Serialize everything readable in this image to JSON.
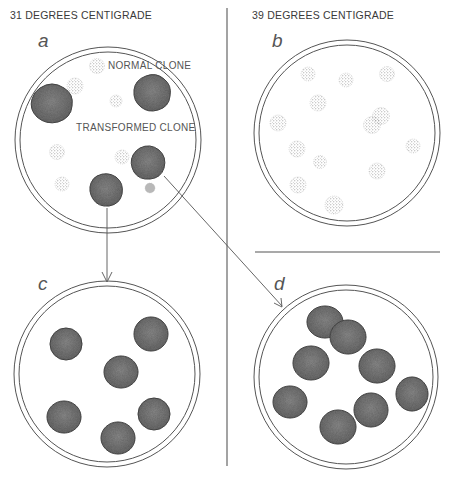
{
  "headers": {
    "left": "31 DEGREES CENTIGRADE",
    "right": "39 DEGREES CENTIGRADE"
  },
  "panels": {
    "a": {
      "label": "a",
      "annotations": {
        "normal": "NORMAL CLONE",
        "transformed": "TRANSFORMED CLONE"
      }
    },
    "b": {
      "label": "b"
    },
    "c": {
      "label": "c"
    },
    "d": {
      "label": "d"
    }
  },
  "colors": {
    "transformed_fill": "#6e6e6e",
    "transformed_stroke": "#4a4a4a",
    "normal_dot": "#9a9a9a",
    "dish_stroke": "#555555",
    "divider": "#888888"
  }
}
